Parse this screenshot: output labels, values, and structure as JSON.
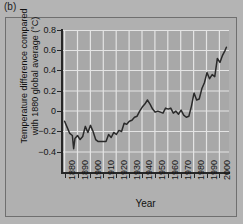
{
  "figure": {
    "panel_label": "(b)"
  },
  "chart_data": {
    "type": "line",
    "title": "",
    "xlabel": "Year",
    "ylabel_line1": "Temperature difference compared",
    "ylabel_line2": "with 1880 global average (°C)",
    "xlim": [
      1878,
      2007
    ],
    "ylim": [
      -0.5,
      0.9
    ],
    "grid": true,
    "legend": "none",
    "xticks": [
      1880,
      1890,
      1900,
      1910,
      1920,
      1930,
      1940,
      1950,
      1960,
      1970,
      1980,
      1990,
      2000
    ],
    "xtick_labels": [
      "1880",
      "1890",
      "1900",
      "1910",
      "1920",
      "1930",
      "1940",
      "1950",
      "1960",
      "1970",
      "1980",
      "1990",
      "2000"
    ],
    "yticks": [
      0.8,
      0.6,
      0.4,
      0.2,
      0,
      -0.2,
      -0.4
    ],
    "ytick_labels": [
      "0.8",
      "0.6",
      "0.4",
      "0.2",
      "0",
      "−0.2",
      "−0.4"
    ],
    "series": [
      {
        "name": "Global temperature difference from 1880 average",
        "x": [
          1880,
          1882,
          1884,
          1886,
          1887,
          1888,
          1890,
          1892,
          1894,
          1896,
          1898,
          1900,
          1902,
          1904,
          1906,
          1908,
          1910,
          1912,
          1914,
          1916,
          1918,
          1920,
          1922,
          1924,
          1926,
          1928,
          1930,
          1932,
          1934,
          1936,
          1938,
          1940,
          1942,
          1944,
          1946,
          1948,
          1950,
          1952,
          1954,
          1956,
          1958,
          1960,
          1962,
          1964,
          1966,
          1968,
          1970,
          1972,
          1974,
          1976,
          1978,
          1980,
          1982,
          1984,
          1986,
          1988,
          1990,
          1992,
          1994,
          1996,
          1998,
          2000,
          2002,
          2004,
          2005
        ],
        "y": [
          0.0,
          -0.06,
          -0.12,
          -0.14,
          -0.27,
          -0.17,
          -0.14,
          -0.18,
          -0.15,
          -0.05,
          -0.11,
          -0.04,
          -0.1,
          -0.18,
          -0.2,
          -0.2,
          -0.2,
          -0.2,
          -0.13,
          -0.16,
          -0.11,
          -0.13,
          -0.09,
          -0.1,
          -0.02,
          -0.03,
          0.0,
          0.01,
          0.04,
          0.05,
          0.1,
          0.14,
          0.17,
          0.21,
          0.17,
          0.12,
          0.09,
          0.1,
          0.09,
          0.08,
          0.13,
          0.12,
          0.13,
          0.08,
          0.1,
          0.07,
          0.11,
          0.06,
          0.04,
          0.05,
          0.15,
          0.28,
          0.21,
          0.22,
          0.32,
          0.38,
          0.48,
          0.42,
          0.46,
          0.44,
          0.62,
          0.58,
          0.65,
          0.7,
          0.73
        ]
      }
    ]
  }
}
